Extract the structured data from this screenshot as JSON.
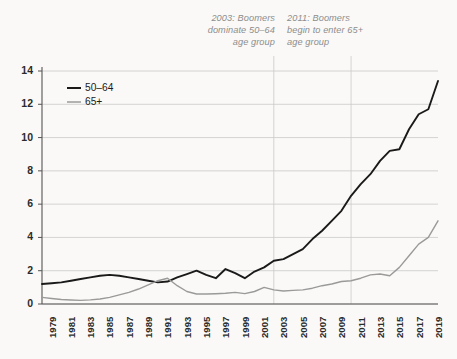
{
  "chart_data": {
    "type": "line",
    "title": "",
    "subtitle": "",
    "xlabel": "",
    "ylabel": "",
    "xlim": [
      1979,
      2020
    ],
    "ylim": [
      0,
      14
    ],
    "y_ticks": [
      0,
      2,
      4,
      6,
      8,
      10,
      12,
      14
    ],
    "grid": true,
    "legend_position": "top-left-inside",
    "x": [
      1979,
      1980,
      1981,
      1982,
      1983,
      1984,
      1985,
      1986,
      1987,
      1988,
      1989,
      1990,
      1991,
      1992,
      1993,
      1994,
      1995,
      1996,
      1997,
      1998,
      1999,
      2000,
      2001,
      2002,
      2003,
      2004,
      2005,
      2006,
      2007,
      2008,
      2009,
      2010,
      2011,
      2012,
      2013,
      2014,
      2015,
      2016,
      2017,
      2018,
      2019,
      2020
    ],
    "x_tick_labels": [
      "1979",
      "1981",
      "1983",
      "1985",
      "1987",
      "1989",
      "1991",
      "1993",
      "1995",
      "1997",
      "1999",
      "2001",
      "2003",
      "2005",
      "2007",
      "2009",
      "2011",
      "2013",
      "2015",
      "2017",
      "2019"
    ],
    "series": [
      {
        "name": "50–64",
        "color": "#1a1a1a",
        "values": [
          1.2,
          1.25,
          1.3,
          1.4,
          1.5,
          1.6,
          1.7,
          1.75,
          1.7,
          1.6,
          1.5,
          1.4,
          1.3,
          1.35,
          1.6,
          1.8,
          2.0,
          1.75,
          1.55,
          2.1,
          1.85,
          1.55,
          1.95,
          2.2,
          2.6,
          2.7,
          3.0,
          3.3,
          3.9,
          4.4,
          5.0,
          5.6,
          6.5,
          7.2,
          7.8,
          8.6,
          9.2,
          9.3,
          10.5,
          11.4,
          11.7,
          13.4
        ]
      },
      {
        "name": "65+",
        "color": "#9a9a9a",
        "values": [
          0.4,
          0.33,
          0.27,
          0.24,
          0.22,
          0.25,
          0.3,
          0.4,
          0.55,
          0.7,
          0.9,
          1.15,
          1.4,
          1.55,
          1.1,
          0.75,
          0.6,
          0.6,
          0.62,
          0.65,
          0.7,
          0.62,
          0.75,
          1.0,
          0.85,
          0.78,
          0.82,
          0.85,
          0.95,
          1.1,
          1.2,
          1.35,
          1.4,
          1.55,
          1.75,
          1.8,
          1.7,
          2.2,
          2.9,
          3.6,
          4.0,
          5.0
        ]
      }
    ],
    "annotations": [
      {
        "id": "ann-2003",
        "year": 2003,
        "text": "2003: Boomers\ndominate 50–64\nage group",
        "color": "#8d8d8d"
      },
      {
        "id": "ann-2011",
        "year": 2011,
        "text": "2011: Boomers\nbegin to enter 65+\nage group",
        "color": "#8d8d8d"
      }
    ],
    "reference_lines": [
      2003,
      2011
    ]
  },
  "style": {
    "background": "#faf9f7",
    "grid_color": "#c9c9c9",
    "axis_color": "#555555",
    "tick_text_color": "#2b2b2b"
  }
}
